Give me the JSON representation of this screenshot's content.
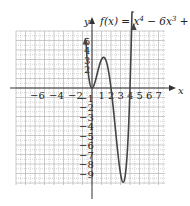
{
  "chart_data": {
    "type": "line",
    "title_parts": {
      "lhs": "f(x) = x",
      "e1": "4",
      "m1": " − 6x",
      "e2": "3",
      "m2": " + 8x",
      "e3": "2"
    },
    "xlabel": "x",
    "ylabel": "y",
    "x_ticks": [
      -6,
      -4,
      -2,
      1,
      2,
      3,
      4,
      5,
      6,
      7
    ],
    "x_tick_labels": [
      "−6",
      "−4",
      "−2",
      "1",
      "2",
      "3",
      "4",
      "5",
      "6",
      "7"
    ],
    "y_ticks": [
      5,
      4,
      3,
      2,
      -1,
      -2,
      -3,
      -4,
      -5,
      -6,
      -7,
      -8,
      -9
    ],
    "y_tick_labels": [
      "5",
      "4",
      "3",
      "2",
      "−1",
      "−2",
      "−3",
      "−4",
      "−5",
      "−6",
      "−7",
      "−8",
      "−9"
    ],
    "xlim": [
      -8,
      7.5
    ],
    "ylim": [
      -10,
      6
    ],
    "grid": true,
    "function": "x^4 - 6x^3 + 8x^2",
    "key_points": [
      {
        "x": 0,
        "y": 0,
        "label": "local min"
      },
      {
        "x": 1,
        "y": 3,
        "label": "local max"
      },
      {
        "x": 2,
        "y": 0,
        "label": "zero"
      },
      {
        "x": 3.3,
        "y": -9.6,
        "label": "local min"
      },
      {
        "x": 4,
        "y": 0,
        "label": "zero"
      }
    ],
    "series": [
      {
        "name": "f(x)",
        "x": [
          -0.6,
          -0.5,
          -0.4,
          -0.3,
          -0.2,
          -0.1,
          0,
          0.25,
          0.5,
          0.75,
          1,
          1.25,
          1.5,
          1.75,
          2,
          2.25,
          2.5,
          2.75,
          3,
          3.25,
          3.5,
          3.75,
          4,
          4.25,
          4.35
        ],
        "y": [
          4.3,
          2.8,
          1.7,
          0.9,
          0.37,
          0.09,
          0,
          0.41,
          1.31,
          2.26,
          3,
          3.3,
          3.09,
          2.34,
          0,
          -2.7,
          -5.47,
          -7.86,
          -9,
          -9.59,
          -8.75,
          -6.15,
          0,
          7.4,
          11.5
        ]
      }
    ]
  },
  "labels": {
    "x_axis": "x",
    "y_axis": "y"
  }
}
